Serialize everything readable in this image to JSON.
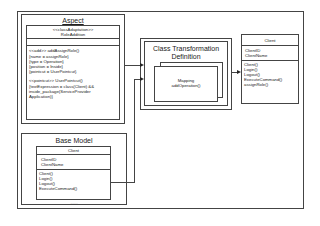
{
  "diagram": {
    "aspect": {
      "title": "Aspect",
      "class_stereotype": "<<classAdaptation>>",
      "class_name": "RoleAddition",
      "add_block": [
        "<<add>> addAssignRole()",
        "{name = assignRole}",
        "{type = Operation}",
        "{position = Inside}",
        "{pointcut = UserPointcut}"
      ],
      "pointcut_block": [
        "<<pointcut>> UserPointcut()",
        "{textExpression = class(Client) &&",
        "inside_package(ServiceProvider",
        "Application)}"
      ]
    },
    "base_model": {
      "title": "Base Model",
      "class_name": "Client",
      "attributes": [
        "ClientID",
        "ClientName"
      ],
      "operations": [
        "Client()",
        "Login()",
        "Logout()",
        "ExecuteCommand()"
      ],
      "ellipsis": "......"
    },
    "transformation": {
      "title_line1": "Class Transformation",
      "title_line2": "Definition",
      "mapping_line1": "Mapping",
      "mapping_line2": "addOperation()"
    },
    "result_client": {
      "class_name": "Client",
      "attributes": [
        "ClientID",
        "ClientName"
      ],
      "operations": [
        "Client()",
        "Login()",
        "Logout()",
        "ExecuteCommand()",
        "assignRole()"
      ]
    }
  }
}
